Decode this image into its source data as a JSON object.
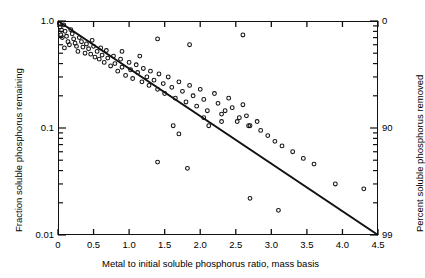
{
  "chart_data": {
    "type": "scatter",
    "title": "",
    "xlabel": "Metal to initial soluble phosphorus ratio, mass basis",
    "ylabel": "Fraction soluble phosphorus remaining",
    "ylabel_right": "Percent soluble phosphorus removed",
    "xlim": [
      0,
      4.5
    ],
    "ylim": [
      0.01,
      1.0
    ],
    "yscale": "log",
    "xscale": "linear",
    "grid": false,
    "legend": null,
    "x_ticks": [
      {
        "value": 0,
        "label": "0"
      },
      {
        "value": 0.5,
        "label": "0.5"
      },
      {
        "value": 1.0,
        "label": "1.0"
      },
      {
        "value": 1.5,
        "label": "1.5"
      },
      {
        "value": 2.0,
        "label": "2.0"
      },
      {
        "value": 2.5,
        "label": "2.5"
      },
      {
        "value": 3.0,
        "label": "3.0"
      },
      {
        "value": 3.5,
        "label": "3.5"
      },
      {
        "value": 4.0,
        "label": "4.0"
      },
      {
        "value": 4.5,
        "label": "4.5"
      }
    ],
    "y_ticks_left": [
      {
        "value": 1.0,
        "label": "1.0"
      },
      {
        "value": 0.1,
        "label": "0.1"
      },
      {
        "value": 0.01,
        "label": "0.01"
      }
    ],
    "y_ticks_right": [
      {
        "value": 1.0,
        "label": "0"
      },
      {
        "value": 0.1,
        "label": "90"
      },
      {
        "value": 0.01,
        "label": "99"
      }
    ],
    "fit_line": {
      "label": "",
      "points": [
        [
          0,
          1.0
        ],
        [
          4.5,
          0.01
        ]
      ]
    },
    "series": [
      {
        "name": "observations",
        "marker": "circle-open",
        "points": [
          [
            0.02,
            0.95
          ],
          [
            0.03,
            0.88
          ],
          [
            0.05,
            0.82
          ],
          [
            0.04,
            0.74
          ],
          [
            0.06,
            0.7
          ],
          [
            0.08,
            0.92
          ],
          [
            0.1,
            0.8
          ],
          [
            0.12,
            0.72
          ],
          [
            0.14,
            0.64
          ],
          [
            0.16,
            0.6
          ],
          [
            0.09,
            0.56
          ],
          [
            0.18,
            0.83
          ],
          [
            0.2,
            0.76
          ],
          [
            0.22,
            0.68
          ],
          [
            0.24,
            0.62
          ],
          [
            0.26,
            0.58
          ],
          [
            0.28,
            0.52
          ],
          [
            0.3,
            0.7
          ],
          [
            0.33,
            0.64
          ],
          [
            0.35,
            0.57
          ],
          [
            0.38,
            0.5
          ],
          [
            0.4,
            0.61
          ],
          [
            0.43,
            0.55
          ],
          [
            0.46,
            0.49
          ],
          [
            0.48,
            0.66
          ],
          [
            0.5,
            0.58
          ],
          [
            0.52,
            0.46
          ],
          [
            0.55,
            0.52
          ],
          [
            0.58,
            0.44
          ],
          [
            0.6,
            0.56
          ],
          [
            0.62,
            0.48
          ],
          [
            0.65,
            0.41
          ],
          [
            0.68,
            0.53
          ],
          [
            0.7,
            0.45
          ],
          [
            0.74,
            0.38
          ],
          [
            0.78,
            0.47
          ],
          [
            0.8,
            0.4
          ],
          [
            0.84,
            0.34
          ],
          [
            0.88,
            0.44
          ],
          [
            0.9,
            0.37
          ],
          [
            0.95,
            0.31
          ],
          [
            1.0,
            0.41
          ],
          [
            1.02,
            0.35
          ],
          [
            1.05,
            0.29
          ],
          [
            1.1,
            0.39
          ],
          [
            1.12,
            0.33
          ],
          [
            1.18,
            0.27
          ],
          [
            1.2,
            0.36
          ],
          [
            1.25,
            0.3
          ],
          [
            1.28,
            0.25
          ],
          [
            1.3,
            0.34
          ],
          [
            1.35,
            0.28
          ],
          [
            1.4,
            0.23
          ],
          [
            1.42,
            0.32
          ],
          [
            1.48,
            0.26
          ],
          [
            1.5,
            0.21
          ],
          [
            1.55,
            0.3
          ],
          [
            1.6,
            0.24
          ],
          [
            1.65,
            0.19
          ],
          [
            1.7,
            0.27
          ],
          [
            1.75,
            0.22
          ],
          [
            1.8,
            0.175
          ],
          [
            1.85,
            0.25
          ],
          [
            1.9,
            0.2
          ],
          [
            1.95,
            0.16
          ],
          [
            2.0,
            0.23
          ],
          [
            2.05,
            0.185
          ],
          [
            2.1,
            0.145
          ],
          [
            2.2,
            0.21
          ],
          [
            2.25,
            0.17
          ],
          [
            2.3,
            0.135
          ],
          [
            2.4,
            0.19
          ],
          [
            2.45,
            0.155
          ],
          [
            2.55,
            0.125
          ],
          [
            2.6,
            0.165
          ],
          [
            2.65,
            0.13
          ],
          [
            2.7,
            0.105
          ],
          [
            2.8,
            0.115
          ],
          [
            2.85,
            0.095
          ],
          [
            2.95,
            0.085
          ],
          [
            3.05,
            0.075
          ],
          [
            3.15,
            0.068
          ],
          [
            3.3,
            0.06
          ],
          [
            3.45,
            0.052
          ],
          [
            3.6,
            0.046
          ],
          [
            3.9,
            0.03
          ],
          [
            4.3,
            0.027
          ],
          [
            1.4,
            0.68
          ],
          [
            1.85,
            0.6
          ],
          [
            2.6,
            0.74
          ],
          [
            2.35,
            0.145
          ],
          [
            2.3,
            0.115
          ],
          [
            1.4,
            0.048
          ],
          [
            1.82,
            0.042
          ],
          [
            2.7,
            0.022
          ],
          [
            3.1,
            0.017
          ],
          [
            2.05,
            0.125
          ],
          [
            2.12,
            0.105
          ],
          [
            1.62,
            0.105
          ],
          [
            1.7,
            0.088
          ],
          [
            0.9,
            0.52
          ],
          [
            1.15,
            0.47
          ],
          [
            2.52,
            0.115
          ],
          [
            2.68,
            0.105
          ]
        ]
      }
    ]
  }
}
